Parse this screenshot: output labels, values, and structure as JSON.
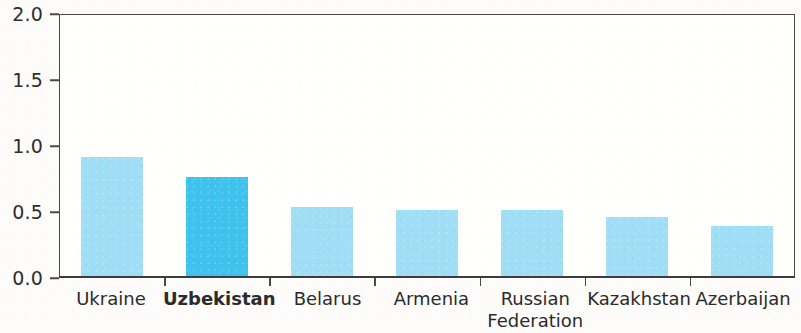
{
  "chart_data": {
    "type": "bar",
    "title": "",
    "subtitle": "",
    "xlabel": "",
    "ylabel": "",
    "ylim": [
      0.0,
      2.0
    ],
    "ytick_labels": [
      "0.0",
      "0.5",
      "1.0",
      "1.5",
      "2.0"
    ],
    "ytick_values": [
      0.0,
      0.5,
      1.0,
      1.5,
      2.0
    ],
    "grid": false,
    "legend": false,
    "categories": [
      "Ukraine",
      "Uzbekistan",
      "Belarus",
      "Armenia",
      "Russian Federation",
      "Kazakhstan",
      "Azerbaijan"
    ],
    "category_lines": [
      [
        "Ukraine"
      ],
      [
        "Uzbekistan"
      ],
      [
        "Belarus"
      ],
      [
        "Armenia"
      ],
      [
        "Russian",
        "Federation"
      ],
      [
        "Kazakhstan"
      ],
      [
        "Azerbaijan"
      ]
    ],
    "values": [
      0.9,
      0.75,
      0.52,
      0.5,
      0.5,
      0.45,
      0.38
    ],
    "highlight_index": 1,
    "colors": {
      "bar": "#9fdef5",
      "bar_highlight": "#3ec3ef",
      "axis": "#4a4a4a",
      "text": "#2b2b2b",
      "background": "#fdfcfa"
    }
  }
}
